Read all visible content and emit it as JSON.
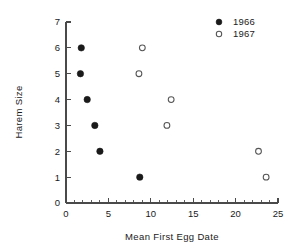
{
  "chart_data": {
    "type": "scatter",
    "title": "",
    "xlabel": "Mean First Egg Date",
    "ylabel": "Harem Size",
    "xlim": [
      0,
      25
    ],
    "ylim": [
      0,
      7
    ],
    "xticks": [
      0,
      5,
      10,
      15,
      20,
      25
    ],
    "yticks": [
      0,
      1,
      2,
      3,
      4,
      5,
      6,
      7
    ],
    "x_minor_tick_interval": 1,
    "grid": false,
    "legend_position": "top-right",
    "series": [
      {
        "name": "1966",
        "marker": "filled-circle",
        "color": "#1a1a1a",
        "points": [
          {
            "x": 1.8,
            "y": 6
          },
          {
            "x": 1.7,
            "y": 5
          },
          {
            "x": 2.5,
            "y": 4
          },
          {
            "x": 3.4,
            "y": 3
          },
          {
            "x": 4.0,
            "y": 2
          },
          {
            "x": 8.7,
            "y": 1
          }
        ]
      },
      {
        "name": "1967",
        "marker": "open-circle",
        "color": "#555555",
        "points": [
          {
            "x": 9.0,
            "y": 6
          },
          {
            "x": 8.6,
            "y": 5
          },
          {
            "x": 12.4,
            "y": 4
          },
          {
            "x": 11.9,
            "y": 3
          },
          {
            "x": 22.7,
            "y": 2
          },
          {
            "x": 23.6,
            "y": 1
          }
        ]
      }
    ]
  },
  "axes": {
    "x_tick_labels": [
      "0",
      "5",
      "10",
      "15",
      "20",
      "25"
    ],
    "y_tick_labels": [
      "0",
      "1",
      "2",
      "3",
      "4",
      "5",
      "6",
      "7"
    ],
    "x_title": "Mean First Egg Date",
    "y_title": "Harem Size"
  },
  "legend": {
    "entries": [
      {
        "label": "1966",
        "marker": "filled-circle"
      },
      {
        "label": "1967",
        "marker": "open-circle"
      }
    ]
  }
}
